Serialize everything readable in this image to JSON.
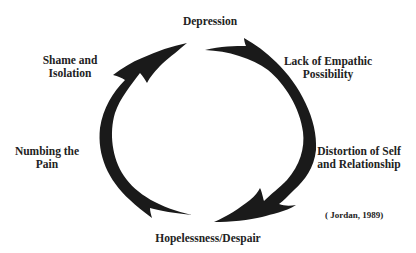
{
  "diagram": {
    "type": "cycle",
    "direction": "clockwise",
    "nodes": [
      {
        "id": "depression",
        "label_lines": [
          "Depression"
        ],
        "position": "top"
      },
      {
        "id": "lack-of-empathic-possibility",
        "label_lines": [
          "Lack of Empathic",
          "Possibility"
        ],
        "position": "top-right"
      },
      {
        "id": "distortion-of-self",
        "label_lines": [
          "Distortion of Self",
          "and Relationship"
        ],
        "position": "bottom-right"
      },
      {
        "id": "hopelessness",
        "label_lines": [
          "Hopelessness/Despair"
        ],
        "position": "bottom"
      },
      {
        "id": "numbing-the-pain",
        "label_lines": [
          "Numbing the",
          "Pain"
        ],
        "position": "left"
      },
      {
        "id": "shame-and-isolation",
        "label_lines": [
          "Shame and",
          "Isolation"
        ],
        "position": "top-left"
      }
    ],
    "arrows": [
      {
        "name": "right-arc-arrow",
        "from": "Depression",
        "to": "Hopelessness/Despair",
        "side": "right"
      },
      {
        "name": "left-arc-arrow",
        "from": "Hopelessness/Despair",
        "to": "Depression",
        "side": "left"
      }
    ],
    "citation": "( Jordan, 1989)",
    "colors": {
      "arrow": "#1a1a1a",
      "text": "#222222",
      "background": "#ffffff"
    }
  }
}
